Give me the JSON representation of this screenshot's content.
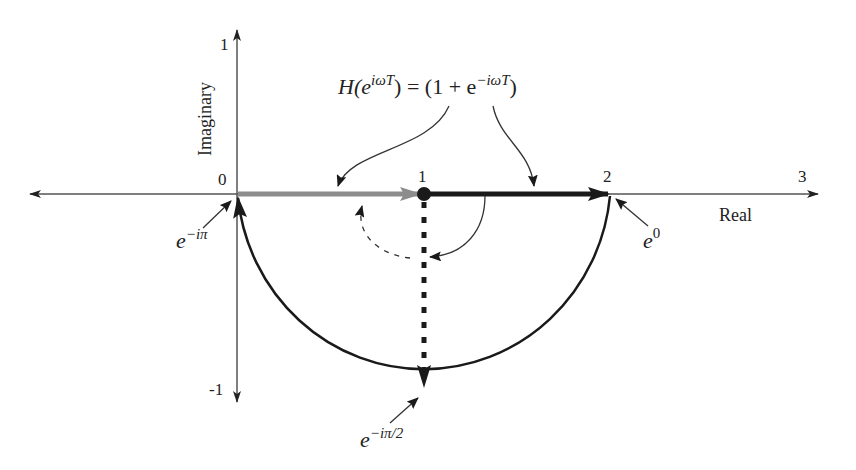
{
  "diagram": {
    "axes": {
      "real_label": "Real",
      "imag_label": "Imaginary",
      "real_ticks": [
        "0",
        "1",
        "2",
        "3"
      ],
      "imag_ticks": [
        "1",
        "-1"
      ]
    },
    "equation": {
      "lhs_H": "H(e",
      "lhs_sup": "iωT",
      "lhs_close": ") = (1 + e",
      "rhs_sup": "−iωT",
      "rhs_close": ")"
    },
    "annotations": {
      "e_minus_i_pi": {
        "base": "e",
        "sup": "−iπ"
      },
      "e_zero": {
        "base": "e",
        "sup": "0"
      },
      "e_minus_i_pi_over_2": {
        "base": "e",
        "sup": "−iπ/2"
      }
    },
    "vectors": [
      {
        "name": "constant-1",
        "from": [
          0,
          0
        ],
        "to": [
          1,
          0
        ],
        "color": "#8c8c8c",
        "style": "solid-thick"
      },
      {
        "name": "e^{-iωT} at ω=0",
        "from": [
          1,
          0
        ],
        "to": [
          2,
          0
        ],
        "color": "#1a1a1a",
        "style": "solid-thick"
      },
      {
        "name": "e^{-iωT} at ωT=π/2",
        "from": [
          1,
          0
        ],
        "to": [
          1,
          -1
        ],
        "color": "#1a1a1a",
        "style": "dashed-thick"
      }
    ],
    "locus": {
      "type": "semicircle",
      "center": [
        1,
        0
      ],
      "radius": 1,
      "from_angle_deg": 0,
      "to_angle_deg": -180,
      "direction": "clockwise from 2 to 0"
    },
    "colors": {
      "axis": "#555555",
      "gray_vector": "#8c8c8c",
      "dark": "#1a1a1a"
    }
  }
}
